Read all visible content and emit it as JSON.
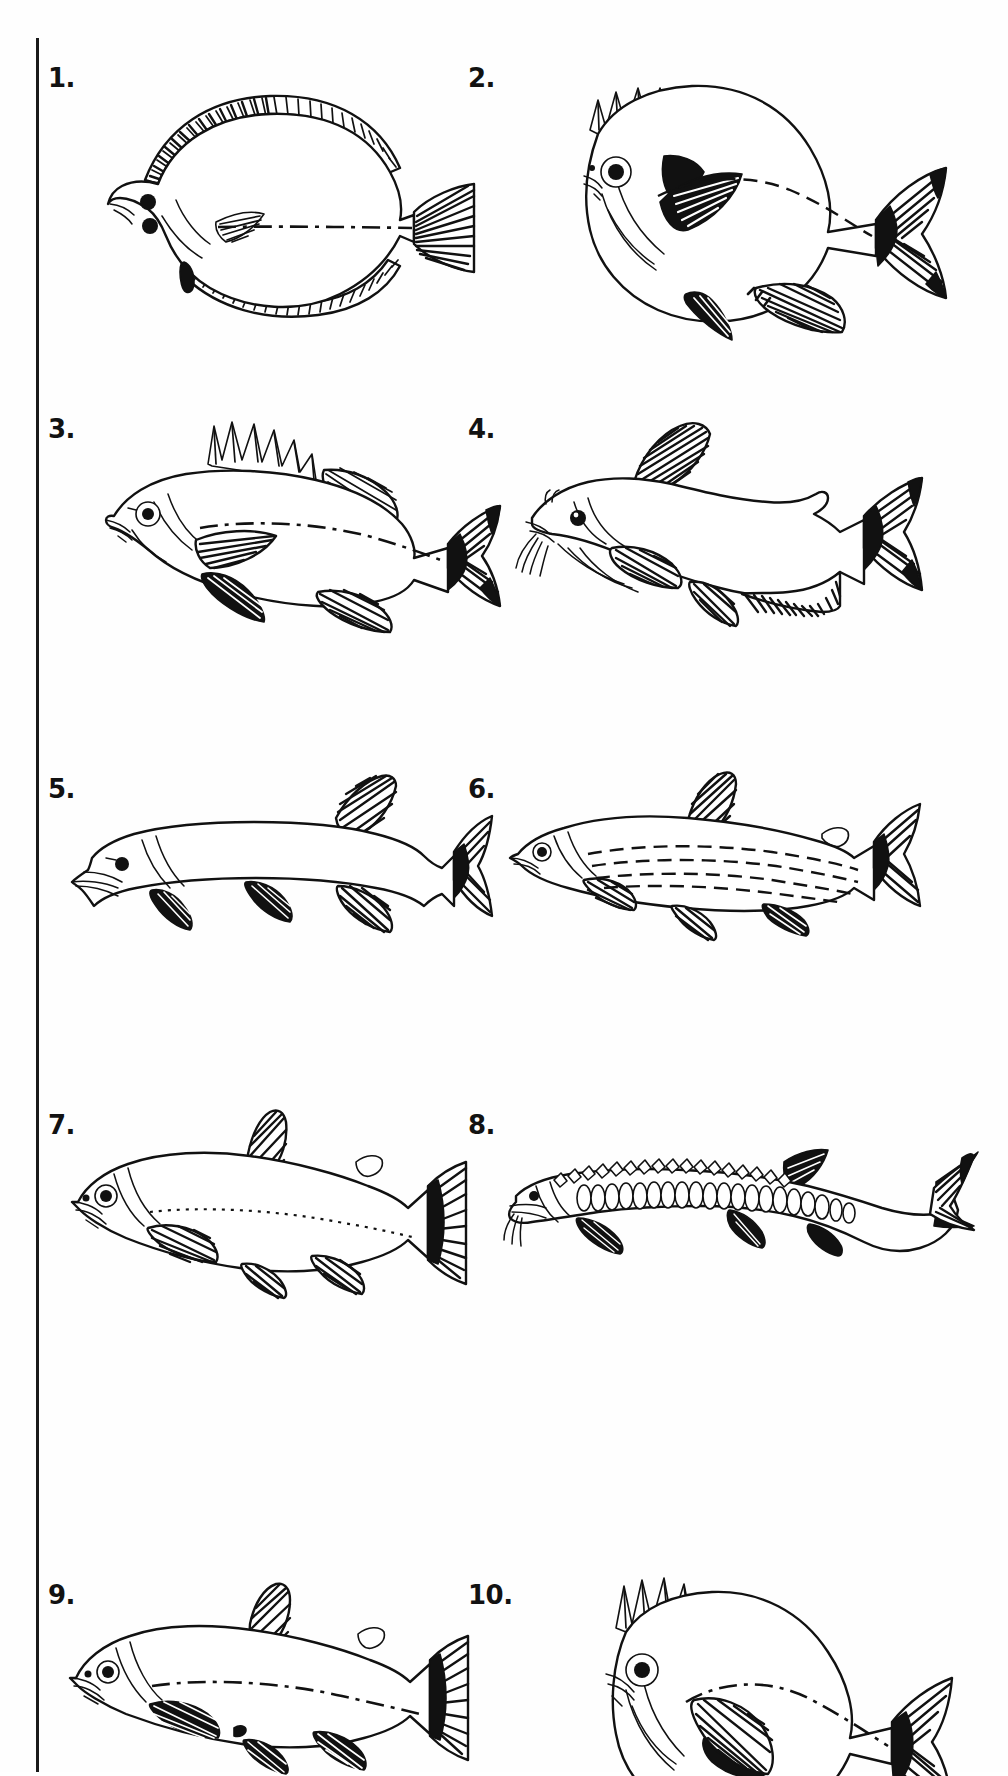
{
  "page": {
    "kind": "fish-identification-plate",
    "background_color": "#ffffff",
    "ink_color": "#111111",
    "margin_rule": {
      "visible": true,
      "orientation": "vertical",
      "color": "#1a1a1a"
    },
    "columns": 2,
    "rows": 5,
    "total_figures": 10
  },
  "figures": [
    {
      "number": "1.",
      "name": "flatfish-flounder",
      "column": "left",
      "row": 1,
      "features": "deep oval compressed body, both eyes on one side, long hatched dorsal and anal fins, fan-shaped caudal fin, dashed lateral line"
    },
    {
      "number": "2.",
      "name": "sunfish-bluegill",
      "column": "right",
      "row": 1,
      "features": "deep round body, spiny front dorsal, dark opercular ear flap, black pectoral blotch, forked hatched tail, dashed lateral line"
    },
    {
      "number": "3.",
      "name": "perch-walleye",
      "column": "left",
      "row": 2,
      "features": "elongate body, separate spiny and soft dorsal fins, forked tail, dashed lateral line"
    },
    {
      "number": "4.",
      "name": "catfish-bullhead",
      "column": "right",
      "row": 2,
      "features": "scaleless body, eight barbels, single soft dorsal, adipose fin, long hatched anal fin, forked tail"
    },
    {
      "number": "5.",
      "name": "pike-musky",
      "column": "left",
      "row": 3,
      "features": "very elongate body, duckbill snout, far-back dorsal opposite anal fin, forked tail"
    },
    {
      "number": "6.",
      "name": "smelt-whitefish",
      "column": "right",
      "row": 3,
      "features": "slender streamlined body, single dorsal, small adipose fin, deeply forked tail, dashed stripes along flank"
    },
    {
      "number": "7.",
      "name": "trout-salmon",
      "column": "left",
      "row": 4,
      "features": "torpedo body, single dorsal plus adipose fin, square-ish tail, faint dotted lateral line"
    },
    {
      "number": "8.",
      "name": "sturgeon",
      "column": "right",
      "row": 4,
      "features": "long armoured body with rows of bony scutes, shovel snout with barbels, heterocercal shark-like tail"
    },
    {
      "number": "9.",
      "name": "trout-char",
      "column": "left",
      "row": 5,
      "features": "robust body, single dorsal plus adipose fin, dark hatched paired fins, dashed lateral line"
    },
    {
      "number": "10.",
      "name": "crappie-sunfish",
      "column": "right",
      "row": 5,
      "features": "deep compressed body, tall spiny dorsal joined to soft dorsal, large hatched pectoral, dashed lateral line"
    }
  ]
}
